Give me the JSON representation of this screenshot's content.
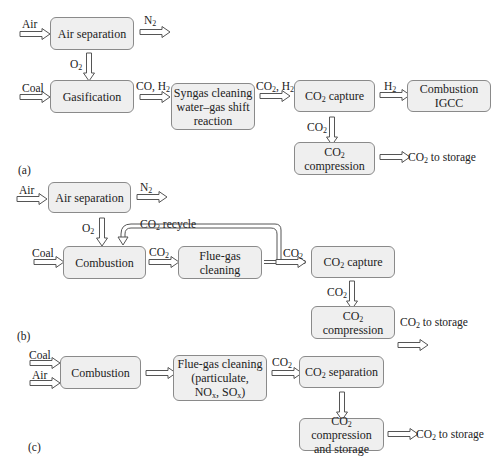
{
  "panels": [
    {
      "label": "(a)",
      "boxes": {
        "air_separation": "Air separation",
        "gasification": "Gasification",
        "syngas_cleaning": [
          "Syngas cleaning",
          "water–gas shift",
          "reaction"
        ],
        "co2_capture": "capture",
        "combustion_igcc": [
          "Combustion",
          "IGCC"
        ],
        "co2_compression_line2": "compression"
      },
      "labels": {
        "air": "Air",
        "n2": "N",
        "o2": "O",
        "coal": "Coal",
        "co_h2": "CO, H",
        "co2_h2": "CO",
        "co2_h2_rest": ", H",
        "h2": "H",
        "co2": "CO",
        "to_storage": " to storage"
      }
    },
    {
      "label": "(b)",
      "boxes": {
        "air_separation": "Air separation",
        "combustion": "Combustion",
        "flue_gas_cleaning": [
          "Flue-gas",
          "cleaning"
        ],
        "co2_capture": "capture",
        "co2_compression_line2": "compression"
      },
      "labels": {
        "air": "Air",
        "n2": "N",
        "o2": "O",
        "coal": "Coal",
        "co2_recycle": " recycle",
        "co2": "CO",
        "to_storage": " to storage"
      }
    },
    {
      "label": "(c)",
      "boxes": {
        "combustion": "Combustion",
        "flue_gas_cleaning": [
          "Flue-gas cleaning",
          "(particulate,",
          "NO",
          ", SO",
          ")"
        ],
        "co2_separation": "separation",
        "co2_compression_storage": [
          "compression",
          "and storage"
        ]
      },
      "labels": {
        "coal": "Coal",
        "air": "Air",
        "co2": "CO",
        "to_storage": " to storage"
      }
    }
  ],
  "common": {
    "sub2": "2",
    "subx": "x",
    "co": "CO"
  },
  "colors": {
    "box_fill": "#efefef",
    "box_border": "#8a8a8a",
    "arrow": "#555555"
  }
}
